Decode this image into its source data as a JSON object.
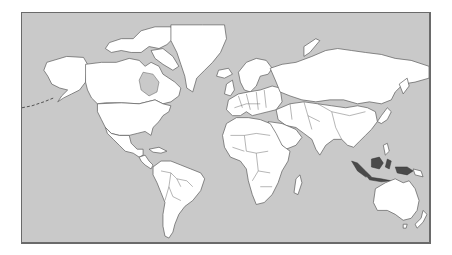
{
  "map": {
    "projection": "Mercator",
    "colors": {
      "ocean": "#c9c9c9",
      "land": "#ffffff",
      "border": "#5a5a5a",
      "highlight": "#4a4a4a",
      "frame": "#6a6a6a"
    },
    "highlighted_regions": [
      "Indonesia"
    ],
    "regions": [
      "North America",
      "Greenland",
      "Central America",
      "South America",
      "Europe",
      "Africa",
      "Middle East",
      "Russia",
      "Asia",
      "Indonesia",
      "Australia",
      "New Zealand",
      "Japan",
      "Madagascar"
    ]
  }
}
